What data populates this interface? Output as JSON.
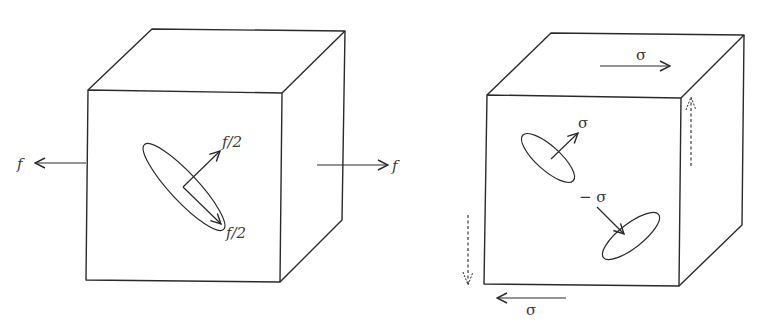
{
  "figure": {
    "left_panel": {
      "description": "Cube under uniaxial tension",
      "labels": {
        "left_force": "f",
        "right_force": "f",
        "normal_component": "f/2",
        "shear_component": "f/2"
      }
    },
    "right_panel": {
      "description": "Cube under pure shear",
      "labels": {
        "top_shear": "σ",
        "bottom_shear": "σ",
        "tensile_plane": "σ",
        "compressive_plane": "− σ"
      }
    },
    "colors": {
      "line": "#2a2a2a",
      "text": "#3a3a3a",
      "background": "#ffffff"
    }
  }
}
